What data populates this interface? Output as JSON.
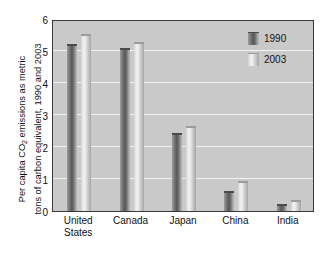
{
  "chart_data": {
    "type": "bar",
    "title": "",
    "subtitle": "",
    "xlabel": "",
    "ylabel_line1": "Per capita CO",
    "ylabel_sub": "2",
    "ylabel_line1b": " emissions as metric",
    "ylabel_line2": "tons of carbon equivalent, 1990 and 2003",
    "categories": [
      "United States",
      "Canada",
      "Japan",
      "China",
      "India"
    ],
    "category_lines": [
      {
        "line1": "United",
        "line2": "States"
      },
      {
        "line1": "Canada",
        "line2": ""
      },
      {
        "line1": "Japan",
        "line2": ""
      },
      {
        "line1": "China",
        "line2": ""
      },
      {
        "line1": "India",
        "line2": ""
      }
    ],
    "series": [
      {
        "name": "1990",
        "color": "#6e6e6e",
        "values": [
          5.2,
          5.05,
          2.42,
          0.6,
          0.2
        ]
      },
      {
        "name": "2003",
        "color": "#e4e4e4",
        "values": [
          5.5,
          5.25,
          2.62,
          0.9,
          0.3
        ]
      }
    ],
    "ylim": [
      0,
      6
    ],
    "y_ticks": [
      0,
      1,
      2,
      3,
      4,
      5,
      6
    ],
    "y_tick_labels": [
      "0",
      "1",
      "2",
      "3",
      "4",
      "5",
      "6"
    ],
    "grid": true,
    "grid_color": "#f2f2f2",
    "grid_axis": "y",
    "legend_position": "top-right",
    "plot_background": "#c9c9c9",
    "figure_background": "#ffffff",
    "axis_color": "#3a3a3a",
    "text_color": "#111111"
  },
  "legend": {
    "entries": [
      {
        "label": "1990",
        "swatch": "bar-swatch-dark"
      },
      {
        "label": "2003",
        "swatch": "bar-swatch-light"
      }
    ]
  }
}
